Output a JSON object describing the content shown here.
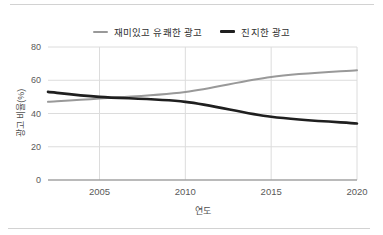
{
  "chart_data": {
    "type": "line",
    "title": "",
    "xlabel": "연도",
    "ylabel": "광고 비율(%)",
    "x": [
      2002,
      2005,
      2010,
      2015,
      2020
    ],
    "series": [
      {
        "name": "재미있고 유쾌한 광고",
        "color": "#999999",
        "stroke_width": 2,
        "values": [
          47,
          49,
          53,
          62,
          66
        ]
      },
      {
        "name": "진지한 광고",
        "color": "#1f1f1f",
        "stroke_width": 2.6,
        "values": [
          53,
          50,
          47,
          38,
          34
        ]
      }
    ],
    "xticks": [
      2005,
      2010,
      2015,
      2020
    ],
    "yticks": [
      0,
      20,
      40,
      60,
      80
    ],
    "xlim": [
      2002,
      2020
    ],
    "ylim": [
      0,
      80
    ],
    "grid": true,
    "legend_position": "top-center",
    "colors": {
      "gridline": "#dcdcdc",
      "axis_line": "#a3a3a3",
      "tick_text": "#5a5a5a"
    }
  }
}
